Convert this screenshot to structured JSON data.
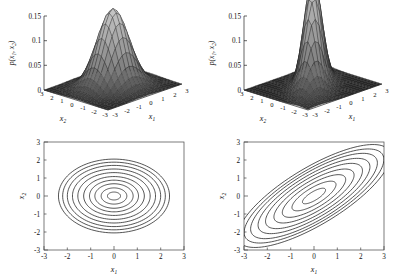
{
  "figure": {
    "caption_present": false,
    "background": "#ffffff",
    "line_color": "#1c1c1c"
  },
  "panels": [
    {
      "id": "surface-uncorrelated",
      "kind": "surface",
      "position": "top-left",
      "zlabel": "p(x",
      "zlabel_sub1": "1",
      "zlabel_mid": ", x",
      "zlabel_sub2": "2",
      "zlabel_end": ")",
      "xlabel": "x",
      "xlabel_sub": "1",
      "ylabel": "x",
      "ylabel_sub": "2",
      "zticks": [
        "0",
        "0.05",
        "0.1",
        "0.15"
      ],
      "xticks": [
        "-3",
        "-2",
        "-1",
        "0",
        "1",
        "2",
        "3"
      ],
      "yticks": [
        "3",
        "2",
        "1",
        "0",
        "-1",
        "-2",
        "-3"
      ]
    },
    {
      "id": "surface-correlated",
      "kind": "surface",
      "position": "top-right",
      "zlabel": "p(x",
      "zlabel_sub1": "1",
      "zlabel_mid": ", x",
      "zlabel_sub2": "2",
      "zlabel_end": ")",
      "xlabel": "x",
      "xlabel_sub": "1",
      "ylabel": "x",
      "ylabel_sub": "2",
      "zticks": [
        "0",
        "0.05",
        "0.1",
        "0.15"
      ],
      "xticks": [
        "-3",
        "-2",
        "-1",
        "0",
        "1",
        "2",
        "3"
      ],
      "yticks": [
        "3",
        "2",
        "1",
        "0",
        "-1",
        "-2",
        "-3"
      ]
    },
    {
      "id": "contour-uncorrelated",
      "kind": "contour",
      "position": "bottom-left",
      "xlabel": "x",
      "xlabel_sub": "1",
      "ylabel": "x",
      "ylabel_sub": "2",
      "xticks": [
        "-3",
        "-2",
        "-1",
        "0",
        "1",
        "2",
        "3"
      ],
      "yticks": [
        "3",
        "2",
        "1",
        "0",
        "-1",
        "-2",
        "-3"
      ]
    },
    {
      "id": "contour-correlated",
      "kind": "contour",
      "position": "bottom-right",
      "xlabel": "x",
      "xlabel_sub": "1",
      "ylabel": "x",
      "ylabel_sub": "2",
      "xticks": [
        "-3",
        "-2",
        "-1",
        "0",
        "1",
        "2",
        "3"
      ],
      "yticks": [
        "3",
        "2",
        "1",
        "0",
        "-1",
        "-2",
        "-3"
      ]
    }
  ],
  "chart_data": [
    {
      "type": "surface",
      "id": "surface-uncorrelated",
      "title": "",
      "xlabel": "x1",
      "ylabel": "x2",
      "zlabel": "p(x1, x2)",
      "xlim": [
        -3,
        3
      ],
      "ylim": [
        -3,
        3
      ],
      "zlim": [
        0,
        0.15
      ],
      "zticks": [
        0,
        0.05,
        0.1,
        0.15
      ],
      "xticks": [
        -3,
        -2,
        -1,
        0,
        1,
        2,
        3
      ],
      "yticks": [
        3,
        2,
        1,
        0,
        -1,
        -2,
        -3
      ],
      "grid": false,
      "legend": "none",
      "distribution": "bivariate-gaussian",
      "mean": [
        0,
        0
      ],
      "covariance": [
        [
          1,
          0
        ],
        [
          0,
          1
        ]
      ],
      "peak_value": 0.159,
      "mesh_n": 21,
      "shading": "faceted-grayscale"
    },
    {
      "type": "surface",
      "id": "surface-correlated",
      "title": "",
      "xlabel": "x1",
      "ylabel": "x2",
      "zlabel": "p(x1, x2)",
      "xlim": [
        -3,
        3
      ],
      "ylim": [
        -3,
        3
      ],
      "zlim": [
        0,
        0.15
      ],
      "zticks": [
        0,
        0.05,
        0.1,
        0.15
      ],
      "xticks": [
        -3,
        -2,
        -1,
        0,
        1,
        2,
        3
      ],
      "yticks": [
        3,
        2,
        1,
        0,
        -1,
        -2,
        -3
      ],
      "grid": false,
      "legend": "none",
      "distribution": "bivariate-gaussian",
      "mean": [
        0,
        0
      ],
      "covariance": [
        [
          1,
          0.7
        ],
        [
          0.7,
          1
        ]
      ],
      "peak_value": 0.111,
      "mesh_n": 21,
      "shading": "faceted-grayscale"
    },
    {
      "type": "contour",
      "id": "contour-uncorrelated",
      "title": "",
      "xlabel": "x1",
      "ylabel": "x2",
      "xlim": [
        -3,
        3
      ],
      "ylim": [
        -3,
        3
      ],
      "xticks": [
        -3,
        -2,
        -1,
        0,
        1,
        2,
        3
      ],
      "yticks": [
        -3,
        -2,
        -1,
        0,
        1,
        2,
        3
      ],
      "grid": false,
      "legend": "none",
      "distribution": "bivariate-gaussian",
      "mean": [
        0,
        0
      ],
      "covariance": [
        [
          1.25,
          0
        ],
        [
          0,
          1.0
        ]
      ],
      "n_levels": 10,
      "ellipse_rotation_deg": 0,
      "ellipse_radii_x": [
        0.28,
        0.55,
        0.82,
        1.05,
        1.3,
        1.55,
        1.78,
        2.0,
        2.2,
        2.38
      ],
      "ellipse_radii_y": [
        0.22,
        0.45,
        0.68,
        0.88,
        1.08,
        1.3,
        1.5,
        1.7,
        1.88,
        2.05
      ]
    },
    {
      "type": "contour",
      "id": "contour-correlated",
      "title": "",
      "xlabel": "x1",
      "ylabel": "x2",
      "xlim": [
        -3,
        3
      ],
      "ylim": [
        -3,
        3
      ],
      "xticks": [
        -3,
        -2,
        -1,
        0,
        1,
        2,
        3
      ],
      "yticks": [
        -3,
        -2,
        -1,
        0,
        1,
        2,
        3
      ],
      "grid": false,
      "legend": "none",
      "distribution": "bivariate-gaussian",
      "mean": [
        0,
        0
      ],
      "covariance": [
        [
          1.6,
          1.25
        ],
        [
          1.25,
          1.6
        ]
      ],
      "n_levels": 9,
      "ellipse_rotation_deg": 40,
      "ellipse_major": [
        0.62,
        1.18,
        1.7,
        2.15,
        2.6,
        3.0,
        3.4,
        3.75,
        4.1
      ],
      "ellipse_minor": [
        0.22,
        0.42,
        0.6,
        0.76,
        0.92,
        1.06,
        1.2,
        1.32,
        1.45
      ]
    }
  ]
}
